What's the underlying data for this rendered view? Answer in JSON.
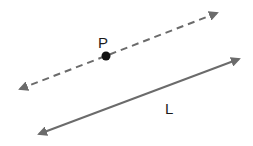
{
  "diagram": {
    "point": {
      "label": "P",
      "x": 106,
      "y": 56
    },
    "line_through_point": {
      "style": "dashed",
      "x1": 20,
      "y1": 89,
      "x2": 217,
      "y2": 13
    },
    "line": {
      "label": "L",
      "style": "solid",
      "x1": 39,
      "y1": 134,
      "x2": 239,
      "y2": 59
    },
    "colors": {
      "line": "#6b6b6b",
      "point": "#111111",
      "text": "#1a1a1a"
    }
  }
}
